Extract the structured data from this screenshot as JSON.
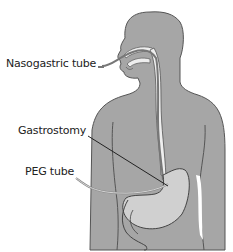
{
  "diagram": {
    "labels": {
      "nasogastric": "Nasogastric tube",
      "gastrostomy": "Gastrostomy",
      "peg": "PEG tube"
    },
    "colors": {
      "body_fill": "#a6a6a6",
      "body_outline": "#555555",
      "stomach_fill": "#d0d0d0",
      "tube_fill": "#eeeeee",
      "leader_line": "#222222",
      "background": "#ffffff"
    }
  }
}
